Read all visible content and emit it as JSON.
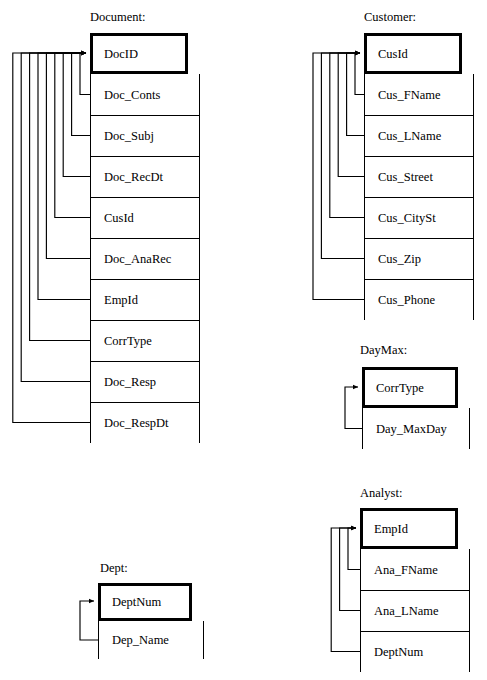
{
  "diagram": {
    "type": "database-schema-dependency-diagram",
    "width": 487,
    "height": 680,
    "line_color": "#000000",
    "background": "#ffffff"
  },
  "entities": [
    {
      "id": "document",
      "title": "Document:",
      "title_x": 90,
      "title_y": 10,
      "key": {
        "name": "DocID"
      },
      "box": {
        "x": 90,
        "y": 33,
        "w": 98,
        "h": 41
      },
      "body": {
        "x": 90,
        "y": 74,
        "w": 110,
        "row_h": 41
      },
      "attributes": [
        "Doc_Conts",
        "Doc_Subj",
        "Doc_RecDt",
        "CusId",
        "Doc_AnaRec",
        "EmpId",
        "CorrType",
        "Doc_Resp",
        "Doc_RespDt"
      ],
      "connector": {
        "side": "left",
        "arrow_x": 90,
        "arrow_y": 53,
        "innermost_x": 80,
        "spacing": 8.4
      }
    },
    {
      "id": "customer",
      "title": "Customer:",
      "title_x": 364,
      "title_y": 10,
      "key": {
        "name": "CusId"
      },
      "box": {
        "x": 364,
        "y": 33,
        "w": 98,
        "h": 41
      },
      "body": {
        "x": 364,
        "y": 74,
        "w": 110,
        "row_h": 41
      },
      "attributes": [
        "Cus_FName",
        "Cus_LName",
        "Cus_Street",
        "Cus_CitySt",
        "Cus_Zip",
        "Cus_Phone"
      ],
      "connector": {
        "side": "left",
        "arrow_x": 364,
        "arrow_y": 53,
        "innermost_x": 355,
        "spacing": 8.4
      }
    },
    {
      "id": "daymax",
      "title": "DayMax:",
      "title_x": 360,
      "title_y": 343,
      "key": {
        "name": "CorrType"
      },
      "box": {
        "x": 362,
        "y": 367,
        "w": 96,
        "h": 41
      },
      "body": {
        "x": 362,
        "y": 408,
        "w": 108,
        "row_h": 41
      },
      "attributes": [
        "Day_MaxDay"
      ],
      "connector": {
        "side": "left",
        "arrow_x": 362,
        "arrow_y": 387,
        "innermost_x": 345,
        "spacing": 8.4
      }
    },
    {
      "id": "analyst",
      "title": "Analyst:",
      "title_x": 360,
      "title_y": 486,
      "key": {
        "name": "EmpId"
      },
      "box": {
        "x": 360,
        "y": 508,
        "w": 98,
        "h": 41
      },
      "body": {
        "x": 360,
        "y": 549,
        "w": 110,
        "row_h": 41
      },
      "attributes": [
        "Ana_FName",
        "Ana_LName",
        "DeptNum"
      ],
      "connector": {
        "side": "left",
        "arrow_x": 360,
        "arrow_y": 528,
        "innermost_x": 348,
        "spacing": 8.4
      }
    },
    {
      "id": "dept",
      "title": "Dept:",
      "title_x": 100,
      "title_y": 561,
      "key": {
        "name": "DeptNum"
      },
      "box": {
        "x": 98,
        "y": 583,
        "w": 94,
        "h": 38
      },
      "body": {
        "x": 98,
        "y": 621,
        "w": 106,
        "row_h": 38
      },
      "attributes": [
        "Dep_Name"
      ],
      "connector": {
        "side": "left",
        "arrow_x": 98,
        "arrow_y": 601,
        "innermost_x": 80,
        "spacing": 8.4
      }
    }
  ]
}
